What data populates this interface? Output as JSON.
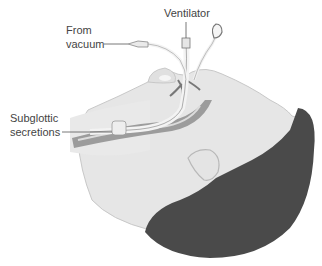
{
  "figure": {
    "labels": {
      "ventilator": "Ventilator",
      "from_vacuum_line1": "From",
      "from_vacuum_line2": "vacuum",
      "subglottic_line1": "Subglottic",
      "subglottic_line2": "secretions"
    },
    "colors": {
      "background": "#ffffff",
      "skin": "#e8e8e8",
      "skin_shadow": "#cfcfcf",
      "hair": "#4a4a4a",
      "airway": "#9a9a9a",
      "tube": "#f2f2f2",
      "label_text": "#444444"
    }
  }
}
